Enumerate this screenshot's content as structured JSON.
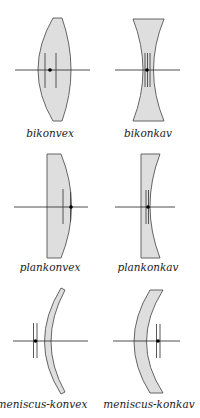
{
  "colors": {
    "lens_fill": "#dedede",
    "lens_stroke": "#555555",
    "axis": "#222222",
    "background": "#ffffff"
  },
  "lenses": [
    {
      "id": "bikonvex",
      "label": "bikonvex",
      "type": "biconvex"
    },
    {
      "id": "bikonkav",
      "label": "bikonkav",
      "type": "biconcave"
    },
    {
      "id": "plankonvex",
      "label": "plankonvex",
      "type": "plano-convex"
    },
    {
      "id": "plankonkav",
      "label": "plankonkav",
      "type": "plano-concave"
    },
    {
      "id": "meniscus-konvex",
      "label": "meniscus-konvex",
      "type": "positive meniscus"
    },
    {
      "id": "meniscus-konkav",
      "label": "meniscus-konkav",
      "type": "negative meniscus"
    }
  ]
}
